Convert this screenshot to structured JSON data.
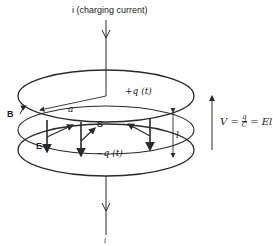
{
  "diagram": {
    "title_current": "i (charging current)",
    "top_charge": "+q (t)",
    "bottom_charge": "−q (t)",
    "radius_label": "a",
    "field_B": "B",
    "field_E": "E",
    "poynting_S": "S",
    "gap_label": "l",
    "bottom_current": "i",
    "equation": "V = q/C = El",
    "equation_parts": {
      "lhs": "V =",
      "num": "q",
      "den": "C",
      "rhs": "= El"
    },
    "colors": {
      "stroke": "#2a2a2a",
      "text": "#222222",
      "background": "#ffffff"
    }
  }
}
